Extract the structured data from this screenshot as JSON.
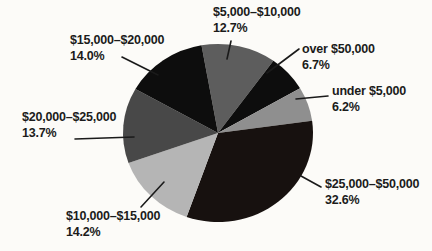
{
  "chart_data": {
    "type": "pie",
    "title": "",
    "legend": "none",
    "label_style": "outside-with-leader-lines",
    "rotation_deg": -10,
    "units": "percent",
    "slices": [
      {
        "label": "$5,000–$10,000",
        "value": 12.7,
        "pct_label": "12.7%",
        "color": "#5d5d5d"
      },
      {
        "label": "over $50,000",
        "value": 6.7,
        "pct_label": "6.7%",
        "color": "#0d0d0d"
      },
      {
        "label": "under $5,000",
        "value": 6.2,
        "pct_label": "6.2%",
        "color": "#8f8f8f"
      },
      {
        "label": "$25,000–$50,000",
        "value": 32.6,
        "pct_label": "32.6%",
        "color": "#17110f"
      },
      {
        "label": "$10,000–$15,000",
        "value": 14.2,
        "pct_label": "14.2%",
        "color": "#b5b5b5"
      },
      {
        "label": "$20,000–$25,000",
        "value": 13.7,
        "pct_label": "13.7%",
        "color": "#484848"
      },
      {
        "label": "$15,000–$20,000",
        "value": 14.0,
        "pct_label": "14.0%",
        "color": "#0d0d0d"
      }
    ],
    "leader_line_color": "#1a1a1a"
  }
}
